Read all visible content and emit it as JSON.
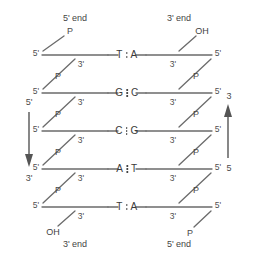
{
  "diagram": {
    "width": 254,
    "height": 259,
    "stroke_color": "#6b6b6b",
    "text_color": "#4a4a4a",
    "background": "#ffffff"
  },
  "headers": {
    "top_left": "5' end",
    "top_right": "3' end",
    "bottom_left": "3' end",
    "bottom_right": "5' end"
  },
  "direction_arrows": {
    "left": {
      "top_label": "5'",
      "bottom_label": "3'",
      "points": "down"
    },
    "right": {
      "top_label": "3",
      "bottom_label": "5",
      "points": "up"
    }
  },
  "base_pairs": [
    {
      "left": "T",
      "right": "A",
      "bonds": 2
    },
    {
      "left": "G",
      "right": "C",
      "bonds": 3
    },
    {
      "left": "C",
      "right": "G",
      "bonds": 3
    },
    {
      "left": "A",
      "right": "T",
      "bonds": 3
    },
    {
      "left": "T",
      "right": "A",
      "bonds": 2
    }
  ],
  "left_strand": {
    "sugar_labels_five": [
      "5'",
      "5'",
      "5'",
      "5'",
      "5'"
    ],
    "sugar_labels_three": [
      "3'",
      "3'",
      "3'",
      "3'",
      "3'"
    ],
    "terminal_top": "P",
    "terminal_bottom": "OH",
    "phosphate_labels": [
      "P",
      "P",
      "P",
      "P"
    ]
  },
  "right_strand": {
    "sugar_labels_three": [
      "3'",
      "3'",
      "3'",
      "3'",
      "3'"
    ],
    "sugar_labels_five": [
      "5'",
      "5'",
      "5'",
      "5'",
      "5'"
    ],
    "terminal_top": "OH",
    "terminal_bottom": "P",
    "phosphate_labels": [
      "P",
      "P",
      "P",
      "P"
    ]
  }
}
